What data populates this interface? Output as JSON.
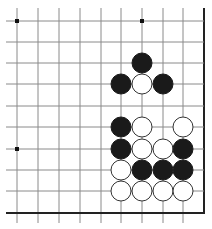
{
  "board": {
    "type": "go-board-fragment",
    "columns": 10,
    "rows": 10,
    "grid_x": [
      17,
      38,
      59,
      80,
      101,
      121,
      142,
      163,
      183,
      204
    ],
    "grid_y": [
      21,
      42,
      63,
      84,
      106,
      127,
      149,
      170,
      191,
      213
    ],
    "edges": [
      "right",
      "bottom"
    ],
    "line_color": "#8a8a8a",
    "edge_color": "#222222",
    "stone_radius": 10,
    "star_points": [
      {
        "col": 0,
        "row": 0
      },
      {
        "col": 6,
        "row": 0
      },
      {
        "col": 0,
        "row": 6
      }
    ],
    "stones": [
      {
        "color": "black",
        "col": 6,
        "row": 2
      },
      {
        "color": "black",
        "col": 5,
        "row": 3
      },
      {
        "color": "white",
        "col": 6,
        "row": 3
      },
      {
        "color": "black",
        "col": 7,
        "row": 3
      },
      {
        "color": "black",
        "col": 5,
        "row": 5
      },
      {
        "color": "white",
        "col": 6,
        "row": 5
      },
      {
        "color": "white",
        "col": 8,
        "row": 5
      },
      {
        "color": "black",
        "col": 5,
        "row": 6
      },
      {
        "color": "white",
        "col": 6,
        "row": 6
      },
      {
        "color": "white",
        "col": 7,
        "row": 6
      },
      {
        "color": "black",
        "col": 8,
        "row": 6
      },
      {
        "color": "white",
        "col": 5,
        "row": 7
      },
      {
        "color": "black",
        "col": 6,
        "row": 7
      },
      {
        "color": "black",
        "col": 7,
        "row": 7
      },
      {
        "color": "black",
        "col": 8,
        "row": 7
      },
      {
        "color": "white",
        "col": 5,
        "row": 8
      },
      {
        "color": "white",
        "col": 6,
        "row": 8
      },
      {
        "color": "white",
        "col": 7,
        "row": 8
      },
      {
        "color": "white",
        "col": 8,
        "row": 8
      }
    ],
    "colors": {
      "black_stone": "#1a1a1a",
      "white_stone": "#ffffff",
      "white_stone_outline": "#333333"
    }
  }
}
